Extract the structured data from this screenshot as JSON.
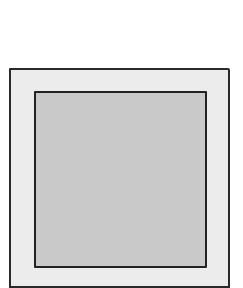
{
  "diagram": {
    "shapes": [
      {
        "id": "outer-square",
        "fill": "#ececec",
        "stroke": "#2a2a2a"
      },
      {
        "id": "inner-square",
        "fill": "#c9c9c9",
        "stroke": "#222222"
      }
    ]
  }
}
